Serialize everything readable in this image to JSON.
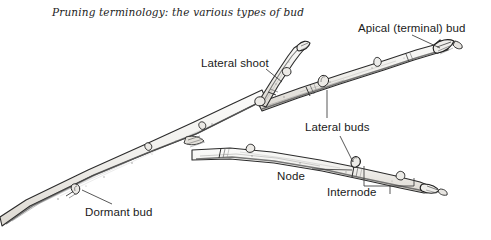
{
  "figure": {
    "title": "Pruning terminology: the various types of bud",
    "kind": "botanical pen-and-ink illustration of a woody branch",
    "background_color": "#ffffff",
    "ink_color": "#1a1a1a",
    "stem_fill_color": "#f0efec",
    "leader_line_color": "#3a3a3a"
  },
  "labels": {
    "apical_bud": "Apical (terminal) bud",
    "lateral_shoot": "Lateral shoot",
    "lateral_buds": "Lateral buds",
    "node": "Node",
    "internode": "Internode",
    "dormant_bud": "Dormant bud"
  }
}
